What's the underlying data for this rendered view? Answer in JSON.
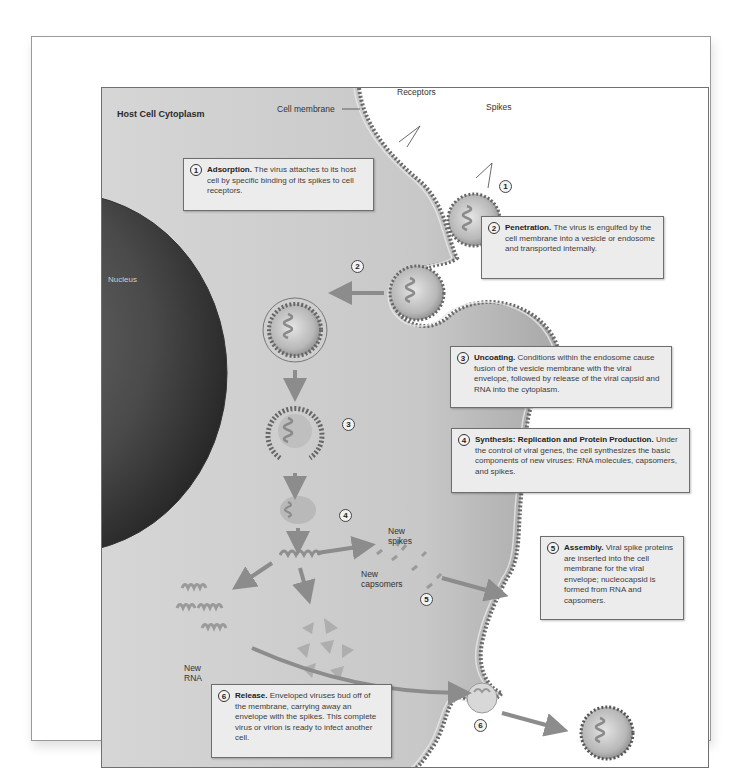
{
  "figure": {
    "title": "Host Cell Cytoplasm",
    "labels": {
      "cell_membrane": "Cell membrane",
      "receptors": "Receptors",
      "spikes": "Spikes",
      "nucleus": "Nucleus",
      "new_spikes": "New spikes",
      "new_spikes_line1": "New",
      "new_spikes_line2": "spikes",
      "new_capsomers_line1": "New",
      "new_capsomers_line2": "capsomers",
      "new_rna_line1": "New",
      "new_rna_line2": "RNA"
    },
    "step_markers": [
      "1",
      "2",
      "3",
      "4",
      "5",
      "6"
    ],
    "steps": [
      {
        "number": "1",
        "heading": "Adsorption.",
        "text": "The virus attaches to its host cell by specific binding of its spikes to cell receptors."
      },
      {
        "number": "2",
        "heading": "Penetration.",
        "text": "The virus is engulfed by the cell membrane into a vesicle or endosome and transported internally."
      },
      {
        "number": "3",
        "heading": "Uncoating.",
        "text": "Conditions within the endosome cause fusion of the vesicle membrane with the viral envelope, followed by release of the viral capsid and RNA into the cytoplasm."
      },
      {
        "number": "4",
        "heading": "Synthesis: Replication and Protein Production.",
        "text": "Under the control of viral genes, the cell synthesizes the basic components of new viruses: RNA molecules, capsomers, and spikes."
      },
      {
        "number": "5",
        "heading": "Assembly.",
        "text": "Viral spike proteins are inserted into the cell membrane for the viral envelope; nucleocapsid is formed from RNA and capsomers."
      },
      {
        "number": "6",
        "heading": "Release.",
        "text": "Enveloped viruses bud off of the membrane, carrying away an envelope with the spikes. This complete virus or virion is ready to infect another cell."
      }
    ],
    "colors": {
      "cytoplasm": "#c9c9c9",
      "nucleus": "#4a4a4a",
      "membrane": "#8a8a8a",
      "box_fill": "#ececec",
      "box_border": "#6e6e6e",
      "arrow": "#8c8c8c"
    }
  }
}
